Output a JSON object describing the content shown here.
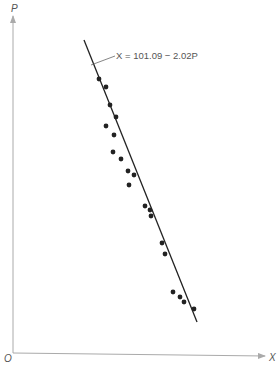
{
  "chart_data": {
    "type": "scatter",
    "title": "",
    "xlabel": "X",
    "ylabel": "P",
    "origin_label": "O",
    "grid": false,
    "legend": null,
    "annotation": "X = 101.09 − 2.02P",
    "regression": {
      "intercept": 101.09,
      "slope": -2.02,
      "equation": "X = 101.09 − 2.02P"
    },
    "points_px": [
      [
        99,
        79
      ],
      [
        106,
        87
      ],
      [
        110,
        105
      ],
      [
        116,
        117
      ],
      [
        106,
        126
      ],
      [
        114,
        135
      ],
      [
        113,
        152
      ],
      [
        121,
        159
      ],
      [
        128,
        171
      ],
      [
        134,
        175
      ],
      [
        129,
        185
      ],
      [
        145,
        206
      ],
      [
        150,
        210
      ],
      [
        151,
        216
      ],
      [
        162,
        243
      ],
      [
        165,
        254
      ],
      [
        173,
        292
      ],
      [
        180,
        297
      ],
      [
        184,
        302
      ],
      [
        194,
        309
      ]
    ],
    "line_px": [
      [
        84,
        40
      ],
      [
        197,
        322
      ]
    ],
    "axes_px": {
      "origin": [
        13,
        353
      ],
      "x_end": [
        266,
        356
      ],
      "y_end": [
        13,
        14
      ]
    }
  },
  "labels": {
    "y_axis": "P",
    "x_axis": "X",
    "origin": "O",
    "equation": "X = 101.09 − 2.02P"
  }
}
